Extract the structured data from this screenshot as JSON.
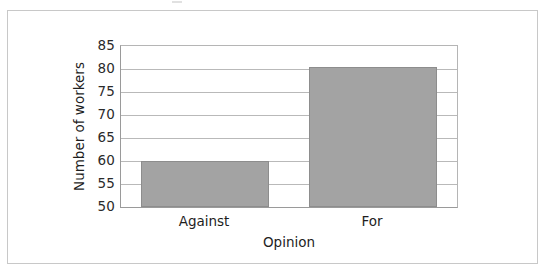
{
  "chart_data": {
    "type": "bar",
    "title": "",
    "subtitle": "",
    "xlabel": "Opinion",
    "ylabel": "Number of workers",
    "categories": [
      "Against",
      "For"
    ],
    "values": [
      60,
      80.5
    ],
    "series": [
      {
        "name": "Number of workers",
        "values": [
          60,
          80.5
        ]
      }
    ],
    "ylim": [
      50,
      85
    ],
    "yticks": [
      50,
      55,
      60,
      65,
      70,
      75,
      80,
      85
    ],
    "ytick_labels": [
      "50",
      "55",
      "60",
      "65",
      "70",
      "75",
      "80",
      "85"
    ],
    "grid": "horizontal",
    "legend": "none",
    "bar_color": "#a3a3a3",
    "bar_edge_color": "#8d8d8d",
    "gridline_color": "#b9b9b9",
    "axis_color": "#9a9a9a",
    "frame_color": "#c8c8c8",
    "background_color": "#ffffff",
    "text_color": "#1e1e1e"
  }
}
